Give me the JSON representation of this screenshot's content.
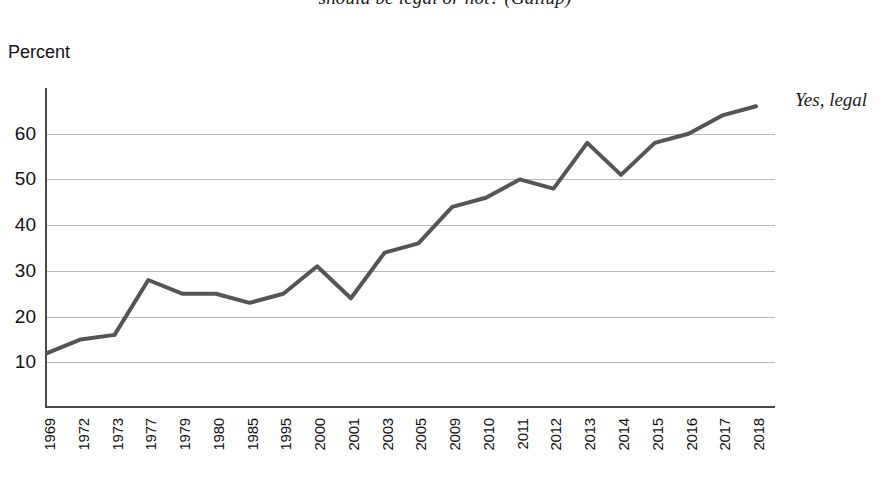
{
  "chart_data": {
    "type": "line",
    "title": "should be legal or not?  (Gallup)",
    "subtitle": "",
    "xlabel": "",
    "ylabel": "Percent",
    "ylim": [
      0,
      70
    ],
    "yticks": [
      10,
      20,
      30,
      40,
      50,
      60
    ],
    "grid": true,
    "legend_position": "right-of-line-end",
    "categories": [
      "1969",
      "1972",
      "1973",
      "1977",
      "1979",
      "1980",
      "1985",
      "1995",
      "2000",
      "2001",
      "2003",
      "2005",
      "2009",
      "2010",
      "2011",
      "2012",
      "2013",
      "2014",
      "2015",
      "2016",
      "2017",
      "2018"
    ],
    "series": [
      {
        "name": "Yes, legal",
        "color": "#555555",
        "values": [
          12,
          15,
          16,
          28,
          25,
          25,
          23,
          25,
          31,
          24,
          34,
          36,
          44,
          46,
          50,
          48,
          58,
          51,
          58,
          60,
          64,
          66
        ]
      }
    ],
    "annotations": [
      {
        "text": "Yes, legal",
        "target": "2018"
      }
    ]
  },
  "chart": {
    "title": "should be legal or not?  (Gallup)",
    "y_axis_caption": "Percent",
    "series_label": "Yes, legal",
    "y_tick_labels": [
      "60",
      "50",
      "40",
      "30",
      "20",
      "10"
    ],
    "x_tick_labels": [
      "1969",
      "1972",
      "1973",
      "1977",
      "1979",
      "1980",
      "1985",
      "1995",
      "2000",
      "2001",
      "2003",
      "2005",
      "2009",
      "2010",
      "2011",
      "2012",
      "2013",
      "2014",
      "2015",
      "2016",
      "2017",
      "2018"
    ],
    "line_color": "#555555",
    "grid_color": "#b9b9b9",
    "axis_color": "#4a4a4a"
  }
}
